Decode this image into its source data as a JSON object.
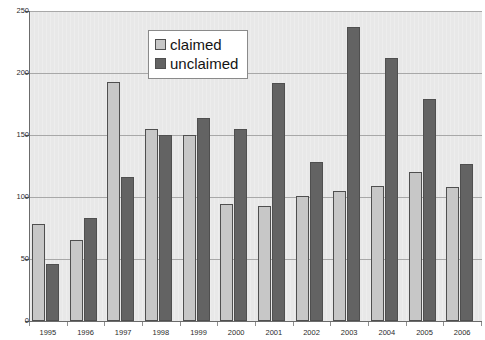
{
  "chart_data": {
    "type": "bar",
    "title": "",
    "xlabel": "",
    "ylabel": "",
    "ylim": [
      0,
      250
    ],
    "yticks": [
      0,
      50,
      100,
      150,
      200,
      250
    ],
    "grid": true,
    "legend_position": "top-center",
    "categories": [
      "1995",
      "1996",
      "1997",
      "1998",
      "1999",
      "2000",
      "2001",
      "2002",
      "2003",
      "2004",
      "2005",
      "2006"
    ],
    "series": [
      {
        "name": "claimed",
        "color": "#c7c7c7",
        "values": [
          78,
          65,
          193,
          155,
          150,
          94,
          93,
          101,
          105,
          109,
          120,
          108
        ]
      },
      {
        "name": "unclaimed",
        "color": "#636363",
        "values": [
          46,
          83,
          116,
          150,
          164,
          155,
          192,
          128,
          237,
          212,
          179,
          127
        ]
      }
    ]
  },
  "legend": {
    "items": [
      {
        "label": "claimed"
      },
      {
        "label": "unclaimed"
      }
    ]
  },
  "axes": {
    "y_tick_labels": [
      "250",
      "200",
      "150",
      "100",
      "50",
      "0"
    ],
    "x_tick_labels": [
      "1995",
      "1996",
      "1997",
      "1998",
      "1999",
      "2000",
      "2001",
      "2002",
      "2003",
      "2004",
      "2005",
      "2006"
    ]
  }
}
